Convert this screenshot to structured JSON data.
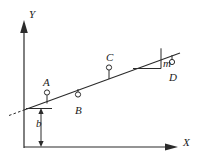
{
  "figure": {
    "type": "line-graph-diagram",
    "background_color": "#ffffff",
    "stroke_color": "#2b2b2b"
  },
  "axes": {
    "y_label": "Y",
    "x_label": "X",
    "y_axis": {
      "x": 24,
      "top": 22,
      "bottom": 148,
      "arrow": "up"
    },
    "x_axis": {
      "y": 147,
      "left": 24,
      "right": 176,
      "arrow": "right"
    }
  },
  "line": {
    "slope_label": "m",
    "intercept_label": "b",
    "solid_from": {
      "x": 24,
      "y": 110
    },
    "solid_to": {
      "x": 178,
      "y": 54
    },
    "dashed_from": {
      "x": 10,
      "y": 115
    },
    "dashed_to": {
      "x": 24,
      "y": 110
    }
  },
  "points": [
    {
      "id": "A",
      "label": "A",
      "label_x": 43,
      "label_y": 77,
      "marker_x": 47,
      "marker_y": 93,
      "stem_to_y": 103
    },
    {
      "id": "B",
      "label": "B",
      "label_x": 75,
      "label_y": 107,
      "marker_x": 78,
      "marker_y": 95,
      "stem_to_y": 100
    },
    {
      "id": "C",
      "label": "C",
      "label_x": 106,
      "label_y": 53,
      "marker_x": 109,
      "marker_y": 68,
      "stem_to_y": 79
    },
    {
      "id": "D",
      "label": "D",
      "label_x": 169,
      "label_y": 74,
      "marker_x": 172,
      "marker_y": 62,
      "stem_to_y": 55
    }
  ],
  "slope_triangle": {
    "label": "m",
    "label_x": 156,
    "label_y": 64,
    "apex": {
      "x": 161,
      "y": 50
    },
    "corner": {
      "x": 161,
      "y": 68
    },
    "base_left": {
      "x": 133,
      "y": 68
    }
  },
  "intercept_dimension": {
    "label": "b",
    "label_x": 37,
    "label_y": 118,
    "line_x": 41,
    "top_y": 108,
    "bottom_y": 147,
    "tick_left": 24,
    "tick_right": 52
  }
}
